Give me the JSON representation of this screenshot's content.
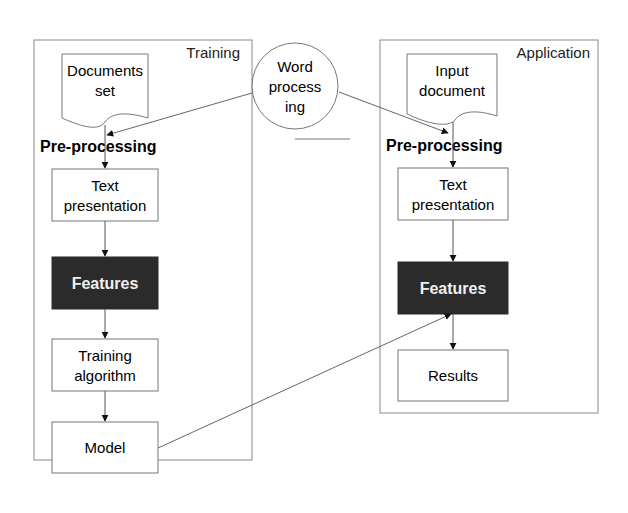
{
  "panels": {
    "training": {
      "title": "Training"
    },
    "application": {
      "title": "Application"
    }
  },
  "training": {
    "documents": [
      "Documents",
      "set"
    ],
    "preprocessing": "Pre-processing",
    "text_presentation": [
      "Text",
      "presentation"
    ],
    "features": "Features",
    "training_algorithm": [
      "Training",
      "algorithm"
    ],
    "model": "Model"
  },
  "word_processing": [
    "Word",
    "process",
    "ing"
  ],
  "application": {
    "input_document": [
      "Input",
      "document"
    ],
    "preprocessing": "Pre-processing",
    "text_presentation": [
      "Text",
      "presentation"
    ],
    "features": "Features",
    "results": "Results"
  },
  "colors": {
    "stroke": "#6e6e6e",
    "features_fill": "#2b2b2b",
    "features_text": "#f0f0f0",
    "text": "#1a1a1a"
  }
}
